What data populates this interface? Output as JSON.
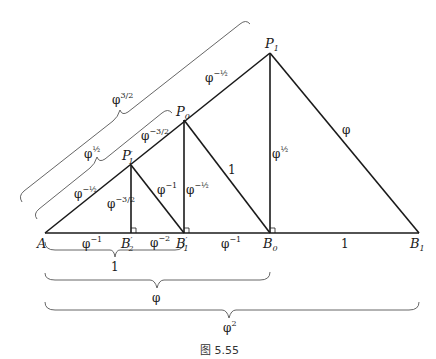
{
  "figure": {
    "caption": "图 5.55",
    "points": {
      "A": {
        "label": "A",
        "sub": ""
      },
      "B2p": {
        "label": "B",
        "sub": "2",
        "prime": "′"
      },
      "B1p": {
        "label": "B",
        "sub": "1",
        "prime": "′"
      },
      "B0": {
        "label": "B",
        "sub": "0"
      },
      "B1": {
        "label": "B",
        "sub": "1"
      },
      "P1p": {
        "label": "P",
        "sub": "1",
        "prime": "′"
      },
      "P0": {
        "label": "P",
        "sub": "0"
      },
      "P1": {
        "label": "P",
        "sub": "1"
      }
    },
    "segment_labels": {
      "A_B2p": {
        "base": "φ",
        "exp": "−1"
      },
      "B2p_B1p": {
        "base": "φ",
        "exp": "−2"
      },
      "B1p_B0": {
        "base": "φ",
        "exp": "−1"
      },
      "B0_B1": {
        "base": "1",
        "exp": ""
      },
      "A_P1p": {
        "base": "φ",
        "exp": "−½"
      },
      "P1p_P0": {
        "base": "φ",
        "exp": "−3/2"
      },
      "P0_P1": {
        "base": "φ",
        "exp": "−½"
      },
      "P1p_B2p": {
        "base": "φ",
        "exp": "−3/2"
      },
      "P1p_B1p": {
        "base": "φ",
        "exp": "−1"
      },
      "P0_B1p": {
        "base": "φ",
        "exp": "−½"
      },
      "P0_B0": {
        "base": "1",
        "exp": ""
      },
      "P1_B0": {
        "base": "φ",
        "exp": "½"
      },
      "P1_B1": {
        "base": "φ",
        "exp": ""
      }
    },
    "braces": {
      "A_P0": {
        "base": "φ",
        "exp": "½"
      },
      "A_P1": {
        "base": "φ",
        "exp": "3/2"
      },
      "A_B1p": {
        "base": "1",
        "exp": ""
      },
      "A_B0": {
        "base": "φ",
        "exp": ""
      },
      "A_B1": {
        "base": "φ",
        "exp": "2"
      }
    },
    "colors": {
      "line": "#1a1a1a",
      "brace": "#555555"
    }
  }
}
